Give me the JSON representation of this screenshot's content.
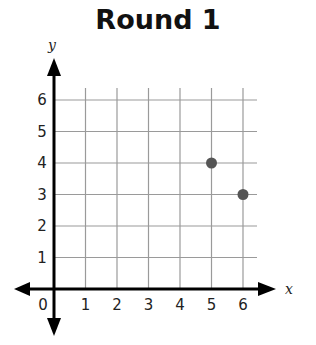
{
  "chart_data": {
    "type": "scatter",
    "title": "Round 1",
    "xlabel": "x",
    "ylabel": "y",
    "xlim": [
      0,
      6
    ],
    "ylim": [
      0,
      6
    ],
    "x_ticks": [
      "0",
      "1",
      "2",
      "3",
      "4",
      "5",
      "6"
    ],
    "y_ticks": [
      "1",
      "2",
      "3",
      "4",
      "5",
      "6"
    ],
    "grid": true,
    "legend": null,
    "series": [
      {
        "name": "points",
        "x": [
          5,
          6
        ],
        "y": [
          4,
          3
        ],
        "color": "#555555"
      }
    ]
  },
  "colors": {
    "grid": "#9a9a9a",
    "axis": "#000000",
    "point": "#555555",
    "background": "#ffffff"
  }
}
